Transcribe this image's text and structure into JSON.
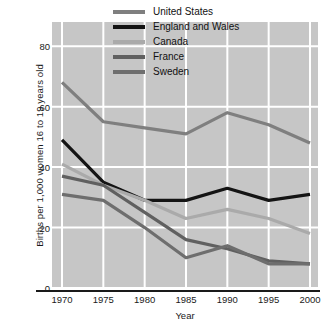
{
  "chart_data": {
    "type": "line",
    "title": "",
    "xlabel": "Year",
    "ylabel": "Births per 1,000 women 16 to 19 years old",
    "x": [
      1970,
      1975,
      1980,
      1985,
      1990,
      1995,
      2000
    ],
    "xtick_labels": [
      "1970",
      "1975",
      "1980",
      "1985",
      "1990",
      "1995",
      "2000"
    ],
    "ytick_labels": [
      "0",
      "20",
      "40",
      "60",
      "80"
    ],
    "yticks": [
      0,
      20,
      40,
      60,
      80
    ],
    "xlim": [
      1970,
      2000
    ],
    "ylim": [
      0,
      88
    ],
    "grid": "both-white",
    "legend_position": "top-right-inside",
    "plot_background": "#c6c6c6",
    "series": [
      {
        "name": "United States",
        "color": "#7f7f7f",
        "width": 3.2,
        "values": [
          68,
          55,
          53,
          51,
          58,
          54,
          48
        ]
      },
      {
        "name": "England and Wales",
        "color": "#141414",
        "width": 3.2,
        "values": [
          49,
          35,
          29,
          29,
          33,
          29,
          31
        ]
      },
      {
        "name": "Canada",
        "color": "#aaaaaa",
        "width": 3.2,
        "values": [
          41,
          34,
          29,
          23,
          26,
          23,
          18
        ]
      },
      {
        "name": "France",
        "color": "#606060",
        "width": 3.2,
        "values": [
          37,
          34,
          25,
          16,
          13,
          9,
          8
        ]
      },
      {
        "name": "Sweden",
        "color": "#6e6e6e",
        "width": 3.2,
        "values": [
          31,
          29,
          20,
          10,
          14,
          8,
          8
        ]
      }
    ]
  },
  "legend": {
    "items": [
      {
        "label": "United States"
      },
      {
        "label": "England and Wales"
      },
      {
        "label": "Canada"
      },
      {
        "label": "France"
      },
      {
        "label": "Sweden"
      }
    ]
  },
  "axes": {
    "y_title": "Births per 1,000 women 16 to 19 years old",
    "x_title": "Year"
  }
}
